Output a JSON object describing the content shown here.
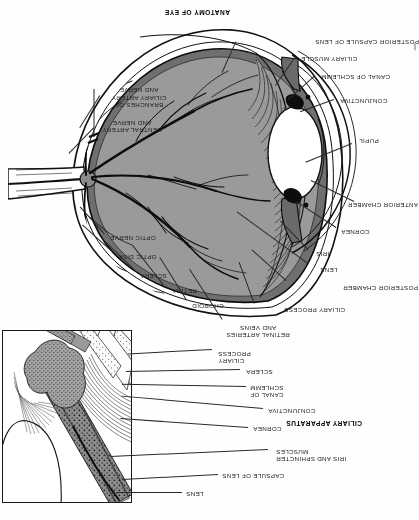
{
  "page": {
    "kind": "scanned-textbook-page",
    "orientation": "upside-down",
    "width": 418,
    "height": 520,
    "background_color": "#fefefe"
  },
  "figures": [
    {
      "id": "ciliary-apparatus",
      "title": "CILIARY APPARATUS",
      "title_position": {
        "x": 56,
        "y": 93
      },
      "frame": {
        "x": 286,
        "y": 17,
        "width": 128,
        "height": 171
      },
      "labels": [
        {
          "key": "lens",
          "text": "LENS",
          "x": 232,
          "y": 25,
          "align": "right"
        },
        {
          "key": "capsule-of-lens",
          "text": "CAPSULE OF LENS",
          "x": 196,
          "y": 43,
          "align": "right"
        },
        {
          "key": "iris-sphincter",
          "text": "IRIS AND SPHINCTER\nMUSCLES",
          "x": 142,
          "y": 60,
          "align": "right"
        },
        {
          "key": "cornea",
          "text": "CORNEA",
          "x": 165,
          "y": 90,
          "align": "right"
        },
        {
          "key": "conjunctiva",
          "text": "CONJUNCTIVA",
          "x": 150,
          "y": 108,
          "align": "right"
        },
        {
          "key": "canal-of-schlemm",
          "text": "CANAL OF\nSCHLEMM",
          "x": 168,
          "y": 124,
          "align": "right"
        },
        {
          "key": "sclera",
          "text": "SCLERA",
          "x": 172,
          "y": 147,
          "align": "right"
        },
        {
          "key": "ciliary-process",
          "text": "CILIARY\nPROCESS",
          "x": 200,
          "y": 158,
          "align": "right"
        }
      ]
    },
    {
      "id": "anatomy-of-eye",
      "title": "ANATOMY OF EYE",
      "title_position": {
        "x": 188,
        "y": 504
      },
      "labels": [
        {
          "key": "retinal-arteries-veins",
          "text": "RETINAL ARTERIES\nAND VEINS",
          "x": 160,
          "y": 185,
          "align": "right"
        },
        {
          "key": "ciliary-process",
          "text": "CILIARY PROCESS",
          "x": 134,
          "y": 209,
          "align": "right"
        },
        {
          "key": "choroid",
          "text": "CHOROID",
          "x": 226,
          "y": 213,
          "align": "right"
        },
        {
          "key": "retina",
          "text": "RETINA",
          "x": 246,
          "y": 228,
          "align": "right"
        },
        {
          "key": "posterior-chamber",
          "text": "POSTERIOR CHAMBER",
          "x": 53,
          "y": 231,
          "align": "right"
        },
        {
          "key": "sclera",
          "text": "SCLERA",
          "x": 278,
          "y": 243,
          "align": "right"
        },
        {
          "key": "lens",
          "text": "LENS",
          "x": 98,
          "y": 249,
          "align": "right"
        },
        {
          "key": "optic-disk",
          "text": "OPTIC DISK",
          "x": 300,
          "y": 262,
          "align": "right"
        },
        {
          "key": "iris",
          "text": "IRIS",
          "x": 102,
          "y": 265,
          "align": "right"
        },
        {
          "key": "optic-nerve",
          "text": "OPTIC NERVE",
          "x": 308,
          "y": 281,
          "align": "right"
        },
        {
          "key": "cornea",
          "text": "CORNEA",
          "x": 77,
          "y": 287,
          "align": "right"
        },
        {
          "key": "anterior-chamber",
          "text": "ANTERIOR CHAMBER",
          "x": 59,
          "y": 314,
          "align": "right"
        },
        {
          "key": "pupil",
          "text": "PUPIL",
          "x": 59,
          "y": 378,
          "align": "right"
        },
        {
          "key": "central-artery-nerve",
          "text": "CENTRAL ARTERY\nAND NERVE",
          "x": 320,
          "y": 389,
          "align": "right"
        },
        {
          "key": "conjunctiva",
          "text": "CONJUNCTIVA",
          "x": 78,
          "y": 418,
          "align": "right"
        },
        {
          "key": "branches-ciliary",
          "text": "BRANCHES OF\nCILIARY ARTERY\nAND NERVE",
          "x": 313,
          "y": 420,
          "align": "right"
        },
        {
          "key": "canal-of-schlemm",
          "text": "CANAL OF SCHLEMM",
          "x": 97,
          "y": 442,
          "align": "right"
        },
        {
          "key": "ciliary-muscle",
          "text": "CILIARY MUSCLE",
          "x": 117,
          "y": 460,
          "align": "right"
        },
        {
          "key": "posterior-capsule",
          "text": "POSTERIOR CAPSULE OF LENS",
          "x": 87,
          "y": 477,
          "align": "right"
        }
      ]
    }
  ],
  "colors": {
    "ink": "#1b1b1b",
    "retina_fill": "#9a9a9a",
    "choroid_fill": "#7d7d7d",
    "sclera_fill": "#ffffff",
    "ciliary_fill": "#8d8d8d",
    "frame_border": "#1a1a1a",
    "page_bg": "#fefefe"
  },
  "edge_artifact": {
    "text": "▌",
    "x": 2,
    "y": 470
  }
}
